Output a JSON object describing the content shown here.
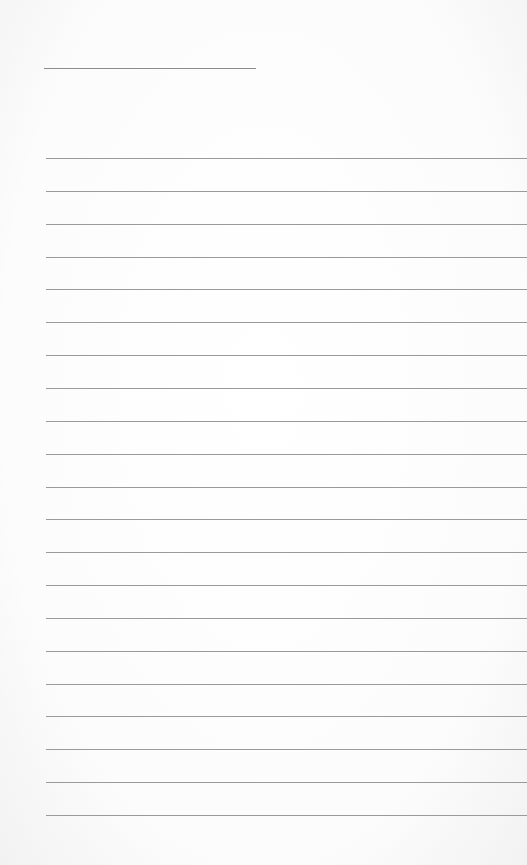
{
  "paper": {
    "type": "lined-paper",
    "header_line": {
      "x": 44,
      "y": 68,
      "width": 212
    },
    "ruled_lines": {
      "count": 21,
      "first_y": 158,
      "spacing": 32.85,
      "left": 46
    },
    "colors": {
      "background": "#fdfdfd",
      "line": "#9a9a9a"
    }
  }
}
